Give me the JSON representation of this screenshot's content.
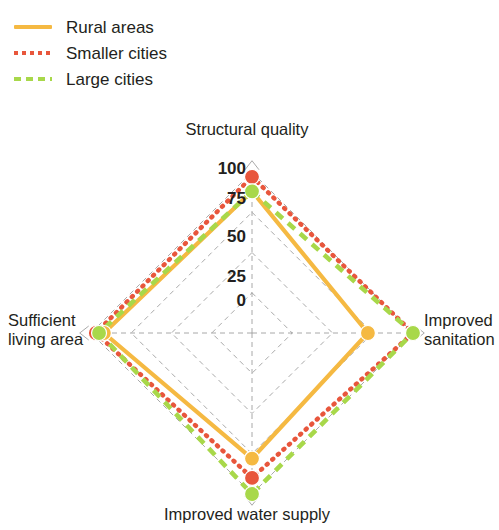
{
  "legend": {
    "items": [
      {
        "label": "Rural areas",
        "color": "#F5B942",
        "style": "solid"
      },
      {
        "label": "Smaller cities",
        "color": "#E8563C",
        "style": "dotted"
      },
      {
        "label": "Large cities",
        "color": "#A8D84A",
        "style": "dashed"
      }
    ]
  },
  "chart_data": {
    "type": "line",
    "subtype": "radar",
    "title": "",
    "categories": [
      "Structural quality",
      "Improved sanitation",
      "Improved water supply",
      "Sufficient living area"
    ],
    "series": [
      {
        "name": "Rural areas",
        "color": "#F5B942",
        "style": "solid",
        "values": [
          88,
          72,
          78,
          92
        ]
      },
      {
        "name": "Smaller cities",
        "color": "#E8563C",
        "style": "dotted",
        "values": [
          97,
          100,
          90,
          97
        ]
      },
      {
        "name": "Large cities",
        "color": "#A8D84A",
        "style": "dashed",
        "values": [
          88,
          100,
          100,
          95
        ]
      }
    ],
    "radial_ticks": [
      0,
      25,
      50,
      75,
      100
    ],
    "rlim": [
      0,
      100
    ],
    "grid": true,
    "grid_color": "#9a9a9a",
    "legend_position": "top-left",
    "axis_label_top": "Structural quality",
    "axis_label_right": "Improved sanitation",
    "axis_label_bottom": "Improved water supply",
    "axis_label_left": "Sufficient living area"
  },
  "ticks": {
    "t0": "0",
    "t25": "25",
    "t50": "50",
    "t75": "75",
    "t100": "100"
  }
}
